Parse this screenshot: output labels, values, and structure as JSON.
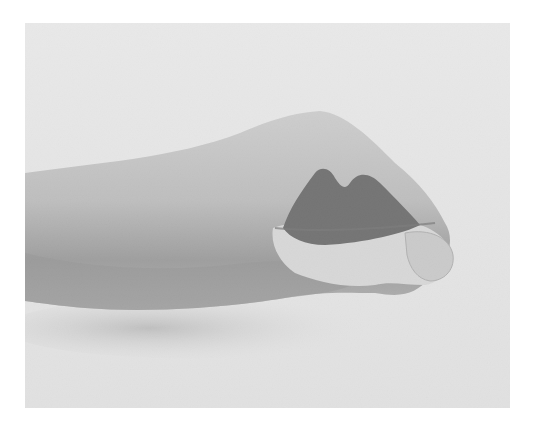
{
  "image": {
    "description": "Grayscale photograph of a clenched fist and forearm, with a dark shape tucked into the curled fingers",
    "colors": {
      "background": "#ffffff",
      "photo_bg": "#d9d9d9",
      "skin_light": "#bdbdbd",
      "skin_mid": "#9a9a9a",
      "skin_shadow": "#6a6a6a",
      "dark_object": "#2e2e2e"
    }
  }
}
